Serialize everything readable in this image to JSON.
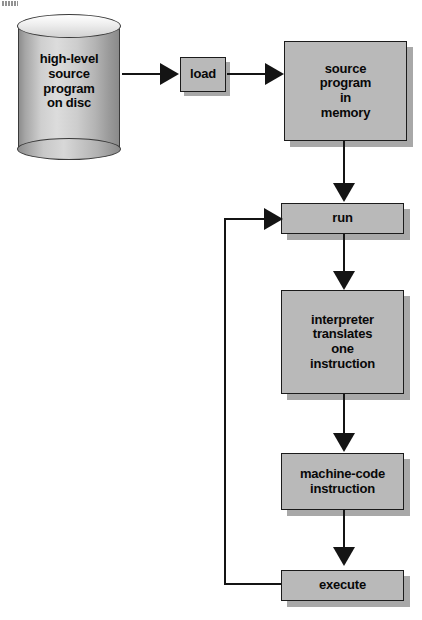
{
  "diagram": {
    "background_color": "#ffffff",
    "node_fill": "#b9b9b9",
    "node_stroke": "#1b1b1b",
    "connector_color": "#141414",
    "shadow_color": "#a8a8a8"
  },
  "nodes": {
    "disc": {
      "shape": "cylinder",
      "lines": [
        "high-level",
        "source",
        "program",
        "on disc"
      ],
      "font_size": "13px"
    },
    "load": {
      "shape": "rect",
      "lines": [
        "load"
      ],
      "font_size": "13px"
    },
    "source_memory": {
      "shape": "rect",
      "lines": [
        "source",
        "program",
        "in",
        "memory"
      ],
      "font_size": "13px"
    },
    "run": {
      "shape": "rect",
      "lines": [
        "run"
      ],
      "font_size": "13px"
    },
    "interpreter": {
      "shape": "rect",
      "lines": [
        "interpreter",
        "translates",
        "one",
        "instruction"
      ],
      "font_size": "13px"
    },
    "machine_code": {
      "shape": "rect",
      "lines": [
        "machine-code",
        "instruction"
      ],
      "font_size": "13px"
    },
    "execute": {
      "shape": "rect",
      "lines": [
        "execute"
      ],
      "font_size": "13px"
    }
  },
  "edges": [
    {
      "id": "disc-to-load",
      "from": "disc",
      "to": "load",
      "direction": "right"
    },
    {
      "id": "load-to-source-memory",
      "from": "load",
      "to": "source_memory",
      "direction": "right"
    },
    {
      "id": "source-memory-to-run",
      "from": "source_memory",
      "to": "run",
      "direction": "down"
    },
    {
      "id": "run-to-interpreter",
      "from": "run",
      "to": "interpreter",
      "direction": "down"
    },
    {
      "id": "interpreter-to-machine-code",
      "from": "interpreter",
      "to": "machine_code",
      "direction": "down"
    },
    {
      "id": "machine-code-to-execute",
      "from": "machine_code",
      "to": "execute",
      "direction": "down"
    },
    {
      "id": "execute-loop-back-to-run",
      "from": "execute",
      "to": "run",
      "direction": "loop-left-up"
    }
  ]
}
